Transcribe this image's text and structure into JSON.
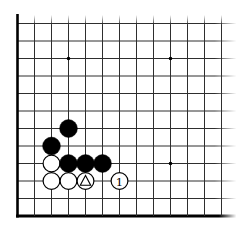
{
  "board": {
    "description": "go-corner-diagram-bottom-left",
    "cols": 13,
    "rows": 12,
    "edges": {
      "left": true,
      "bottom": true,
      "top": false,
      "right": false
    },
    "star_points": [
      {
        "col": 4,
        "row": 3
      },
      {
        "col": 10,
        "row": 3
      },
      {
        "col": 10,
        "row": 9
      }
    ],
    "stones": [
      {
        "col": 4,
        "row": 7,
        "color": "black"
      },
      {
        "col": 3,
        "row": 8,
        "color": "black"
      },
      {
        "col": 3,
        "row": 9,
        "color": "white"
      },
      {
        "col": 4,
        "row": 9,
        "color": "black"
      },
      {
        "col": 5,
        "row": 9,
        "color": "black"
      },
      {
        "col": 6,
        "row": 9,
        "color": "black"
      },
      {
        "col": 3,
        "row": 10,
        "color": "white"
      },
      {
        "col": 4,
        "row": 10,
        "color": "white"
      },
      {
        "col": 5,
        "row": 10,
        "color": "white",
        "mark": "triangle"
      },
      {
        "col": 7,
        "row": 10,
        "color": "white",
        "label": "1"
      }
    ],
    "colors": {
      "background": "#ffffff",
      "line": "#2e2e2e",
      "edge": "#000000",
      "black_stone": "#000000",
      "white_stone": "#ffffff",
      "stone_outline": "#000000",
      "mark": "#000000"
    }
  }
}
